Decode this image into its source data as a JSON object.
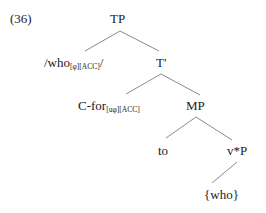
{
  "example_number": "(36)",
  "nodes": {
    "tp": {
      "label": "TP"
    },
    "who_phon": {
      "prefix": "/who",
      "subscript": "[φ][ACC]",
      "suffix": "/"
    },
    "t_bar": {
      "label": "T′"
    },
    "c_for": {
      "label": "C-for",
      "subscript": "[uφ][ACC]"
    },
    "mp": {
      "label": "MP"
    },
    "to": {
      "label": "to"
    },
    "vstar_p": {
      "label": "v*P"
    },
    "who_set": {
      "label": "{who}"
    }
  },
  "edges": [
    {
      "from": "TP",
      "to": "/who/"
    },
    {
      "from": "TP",
      "to": "T′"
    },
    {
      "from": "T′",
      "to": "C-for"
    },
    {
      "from": "T′",
      "to": "MP"
    },
    {
      "from": "MP",
      "to": "to"
    },
    {
      "from": "MP",
      "to": "v*P"
    },
    {
      "from": "v*P",
      "to": "{who}"
    }
  ]
}
